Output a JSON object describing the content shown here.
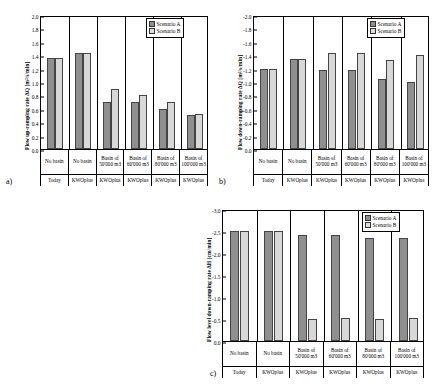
{
  "figure": {
    "panels": [
      {
        "tag": "a)",
        "legend": {
          "series_a": "Scenario A",
          "series_b": "Scenario B"
        },
        "chart_data": {
          "type": "bar",
          "title": "",
          "ylabel": "Flow up-ramping rate ΔQ [m³/s/min]",
          "xlabel": "",
          "ylim": [
            0.0,
            2.0
          ],
          "ytick_step": 0.2,
          "y_inverted": false,
          "yticks": [
            "0.0",
            "0.2",
            "0.4",
            "0.6",
            "0.8",
            "1.0",
            "1.2",
            "1.4",
            "1.6",
            "1.8",
            "2.0"
          ],
          "categories": [
            "No basin",
            "No basin",
            "Basin of 50'000 m3",
            "Basin of 60'000 m3",
            "Basin of 80'000 m3",
            "Basin of 100'000 m3"
          ],
          "subcategories": [
            "Today",
            "KWOplus",
            "KWOplus",
            "KWOplus",
            "KWOplus",
            "KWOplus"
          ],
          "series": [
            {
              "name": "Scenario A",
              "values": [
                1.36,
                1.43,
                0.7,
                0.7,
                0.6,
                0.51
              ]
            },
            {
              "name": "Scenario B",
              "values": [
                1.36,
                1.44,
                0.9,
                0.8,
                0.7,
                0.52
              ]
            }
          ],
          "legend_position": "top-right",
          "grid": false
        }
      },
      {
        "tag": "b)",
        "legend": {
          "series_a": "Scenario A",
          "series_b": "Scenario B"
        },
        "chart_data": {
          "type": "bar",
          "title": "",
          "ylabel": "Flow down-ramping rate ΔQ [m³/s/min]",
          "xlabel": "",
          "ylim": [
            -2.0,
            0.0
          ],
          "ytick_step": 0.2,
          "y_inverted": true,
          "yticks": [
            "-2.0",
            "-1.8",
            "-1.6",
            "-1.4",
            "-1.2",
            "-1.0",
            "-0.8",
            "-0.6",
            "-0.4",
            "-0.2",
            "0.0"
          ],
          "categories": [
            "No basin",
            "No basin",
            "Basin of 50'000 m3",
            "Basin of 60'000 m3",
            "Basin of 80'000 m3",
            "Basin of 100'000 m3"
          ],
          "subcategories": [
            "Today",
            "KWOplus",
            "KWOplus",
            "KWOplus",
            "KWOplus",
            "KWOplus"
          ],
          "series": [
            {
              "name": "Scenario A",
              "values": [
                -1.2,
                -1.35,
                -1.18,
                -1.18,
                -1.05,
                -1.0
              ]
            },
            {
              "name": "Scenario B",
              "values": [
                -1.2,
                -1.35,
                -1.43,
                -1.43,
                -1.33,
                -1.41
              ]
            }
          ],
          "legend_position": "top-right",
          "grid": false
        }
      },
      {
        "tag": "c)",
        "legend": {
          "series_a": "Scenario A",
          "series_b": "Scenario B"
        },
        "chart_data": {
          "type": "bar",
          "title": "",
          "ylabel": "Flow level down-ramping rate ΔH [cm/min]",
          "xlabel": "",
          "ylim": [
            -3.0,
            0.0
          ],
          "ytick_step": 0.5,
          "y_inverted": true,
          "yticks": [
            "-3.0",
            "-2.5",
            "-2.0",
            "-1.5",
            "-1.0",
            "-0.5",
            "0.0"
          ],
          "categories": [
            "No basin",
            "No basin",
            "Basin of 50'000 m3",
            "Basin of 60'000 m3",
            "Basin of 80'000 m3",
            "Basin of 100'000 m3"
          ],
          "subcategories": [
            "Today",
            "KWOplus",
            "KWOplus",
            "KWOplus",
            "KWOplus",
            "KWOplus"
          ],
          "series": [
            {
              "name": "Scenario A",
              "values": [
                -2.5,
                -2.5,
                -2.4,
                -2.4,
                -2.35,
                -2.35
              ]
            },
            {
              "name": "Scenario B",
              "values": [
                -2.5,
                -2.5,
                -0.5,
                -0.52,
                -0.5,
                -0.52
              ]
            }
          ],
          "legend_position": "top-right",
          "grid": false
        }
      }
    ],
    "colors": {
      "series_a": "#8f8f8f",
      "series_b": "#d8d8d8",
      "axis": "#000000"
    }
  }
}
